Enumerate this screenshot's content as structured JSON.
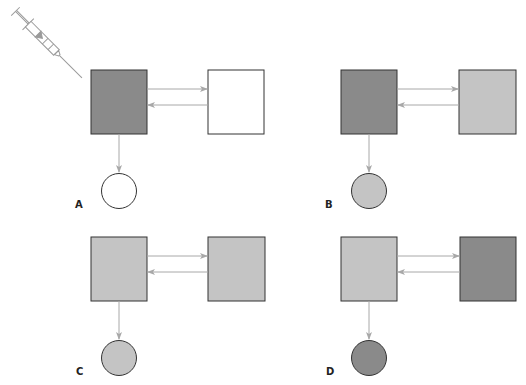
{
  "colors": {
    "dark": "#8a8a8a",
    "light": "#c4c4c4",
    "white": "#ffffff",
    "outline": "#333333",
    "arrow": "#a8a8a8"
  },
  "syringe": {
    "icon": "syringe-icon",
    "panel": "A"
  },
  "panels": [
    {
      "label": "A",
      "left_fill": "dark",
      "right_fill": "white",
      "circle_fill": "white"
    },
    {
      "label": "B",
      "left_fill": "dark",
      "right_fill": "light",
      "circle_fill": "light"
    },
    {
      "label": "C",
      "left_fill": "light",
      "right_fill": "light",
      "circle_fill": "light"
    },
    {
      "label": "D",
      "left_fill": "light",
      "right_fill": "dark",
      "circle_fill": "dark"
    }
  ]
}
